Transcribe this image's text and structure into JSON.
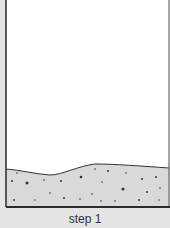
{
  "diagram": {
    "caption": "step 1",
    "container": {
      "interior_color": "#ffffff",
      "border_color": "#2a2a2a",
      "background_color": "#e4e4e4"
    },
    "sediment": {
      "fill_color": "#d9d9d9",
      "particle_color": "#333333",
      "label": "sediment layer"
    }
  }
}
